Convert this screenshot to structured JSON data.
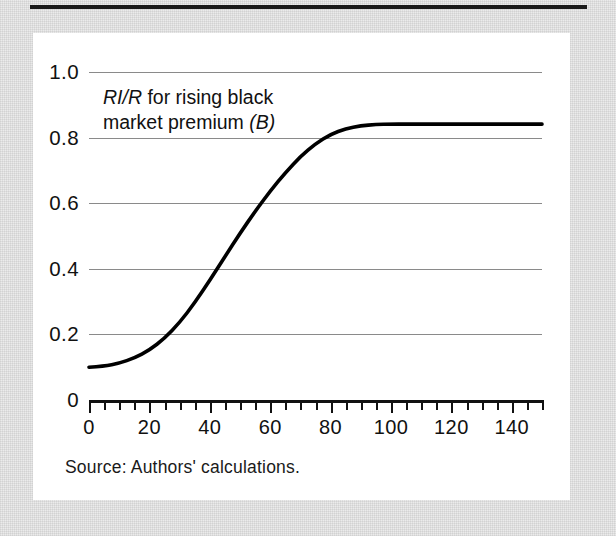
{
  "figure": {
    "source_note": "Source: Authors' calculations."
  },
  "chart_data": {
    "type": "line",
    "title": "",
    "subtitle": "",
    "xlabel": "",
    "ylabel": "",
    "xlim": [
      0,
      150
    ],
    "ylim": [
      0,
      1.0
    ],
    "grid": "horizontal",
    "legend": "none",
    "annotations": [
      {
        "text": "RI/R for rising black market premium (B)",
        "parts": [
          {
            "text": "RI/R",
            "style": "italic"
          },
          {
            "text": " for rising black",
            "style": "normal"
          },
          {
            "text": "market premium ",
            "style": "normal"
          },
          {
            "text": "(B)",
            "style": "italic"
          }
        ],
        "x": 8,
        "y": 0.93
      }
    ],
    "y_ticks": [
      {
        "value": 1.0,
        "label": "1.0"
      },
      {
        "value": 0.8,
        "label": "0.8"
      },
      {
        "value": 0.6,
        "label": "0.6"
      },
      {
        "value": 0.4,
        "label": "0.4"
      },
      {
        "value": 0.2,
        "label": "0.2"
      },
      {
        "value": 0.0,
        "label": "0"
      }
    ],
    "x_ticks_major": [
      {
        "value": 0,
        "label": "0"
      },
      {
        "value": 20,
        "label": "20"
      },
      {
        "value": 40,
        "label": "40"
      },
      {
        "value": 60,
        "label": "60"
      },
      {
        "value": 80,
        "label": "80"
      },
      {
        "value": 100,
        "label": "100"
      },
      {
        "value": 120,
        "label": "120"
      },
      {
        "value": 140,
        "label": "140"
      }
    ],
    "x_tick_minor_step": 5,
    "series": [
      {
        "name": "RI/R for rising black market premium (B)",
        "color": "#000000",
        "linewidth": 3.6,
        "x": [
          0,
          5,
          10,
          15,
          20,
          25,
          30,
          35,
          40,
          45,
          50,
          55,
          60,
          65,
          70,
          75,
          80,
          85,
          90,
          95,
          100,
          105,
          110,
          115,
          120,
          125,
          130,
          135,
          140,
          145,
          150
        ],
        "y": [
          0.1,
          0.103,
          0.112,
          0.128,
          0.152,
          0.188,
          0.236,
          0.296,
          0.365,
          0.437,
          0.508,
          0.575,
          0.637,
          0.693,
          0.742,
          0.781,
          0.81,
          0.827,
          0.836,
          0.84,
          0.841,
          0.841,
          0.841,
          0.841,
          0.841,
          0.841,
          0.841,
          0.841,
          0.841,
          0.841,
          0.841
        ]
      }
    ]
  }
}
